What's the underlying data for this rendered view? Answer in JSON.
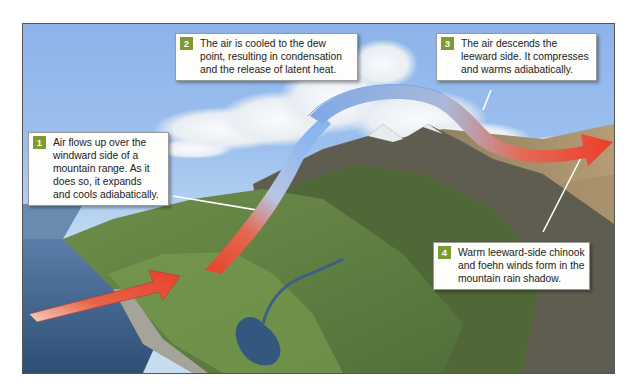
{
  "diagram": {
    "colors": {
      "sky": "#8db3ea",
      "badge": "#7e9b31",
      "warm_air": "#e9432f",
      "cool_air": "#8fb7ee",
      "ocean": "#3d5f86",
      "land": "#5d7a3c",
      "mountain": "#6e6a5c"
    },
    "callouts": [
      {
        "number": "1",
        "lines": [
          "Air flows up over the",
          "windward side of a",
          "mountain range. As it",
          "does so, it expands",
          "and cools adiabatically."
        ]
      },
      {
        "number": "2",
        "lines": [
          "The air is cooled to the dew",
          "point, resulting in condensation",
          "and the release of latent heat."
        ]
      },
      {
        "number": "3",
        "lines": [
          "The air descends the",
          "leeward side. It compresses",
          "and warms adiabatically."
        ]
      },
      {
        "number": "4",
        "lines": [
          "Warm leeward-side chinook",
          "and foehn winds form in the",
          "mountain rain shadow."
        ]
      }
    ]
  }
}
